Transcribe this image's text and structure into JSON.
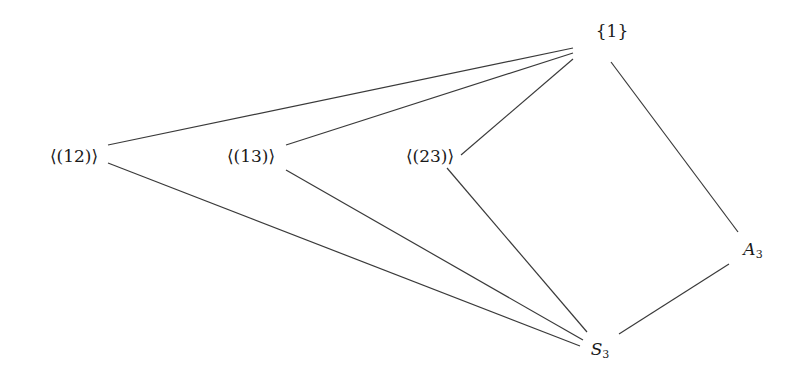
{
  "diagram": {
    "nodes": {
      "trivial": {
        "label": "{1}",
        "x": 612,
        "y": 31
      },
      "c12": {
        "label": "⟨(12)⟩",
        "x": 74,
        "y": 156
      },
      "c13": {
        "label": "⟨(13)⟩",
        "x": 251,
        "y": 156
      },
      "c23": {
        "label": "⟨(23)⟩",
        "x": 430,
        "y": 156
      },
      "a3": {
        "label_main": "A",
        "label_sub": "3",
        "x": 753,
        "y": 250
      },
      "s3": {
        "label_main": "S",
        "label_sub": "3",
        "x": 600,
        "y": 350
      }
    },
    "edges": [
      {
        "from": "c12",
        "to": "trivial",
        "x1": 108,
        "y1": 145,
        "x2": 573,
        "y2": 48
      },
      {
        "from": "c13",
        "to": "trivial",
        "x1": 286,
        "y1": 145,
        "x2": 573,
        "y2": 53
      },
      {
        "from": "c23",
        "to": "trivial",
        "x1": 461,
        "y1": 155,
        "x2": 573,
        "y2": 59
      },
      {
        "from": "a3",
        "to": "trivial",
        "x1": 738,
        "y1": 232,
        "x2": 611,
        "y2": 62
      },
      {
        "from": "c12",
        "to": "s3",
        "x1": 108,
        "y1": 163,
        "x2": 580,
        "y2": 346
      },
      {
        "from": "c13",
        "to": "s3",
        "x1": 286,
        "y1": 170,
        "x2": 583,
        "y2": 340
      },
      {
        "from": "c23",
        "to": "s3",
        "x1": 447,
        "y1": 168,
        "x2": 587,
        "y2": 332
      },
      {
        "from": "s3",
        "to": "a3",
        "x1": 619,
        "y1": 334,
        "x2": 729,
        "y2": 264
      }
    ],
    "colors": {
      "line": "#3a3a3a",
      "text": "#1a1a1a",
      "background": "#ffffff"
    }
  }
}
